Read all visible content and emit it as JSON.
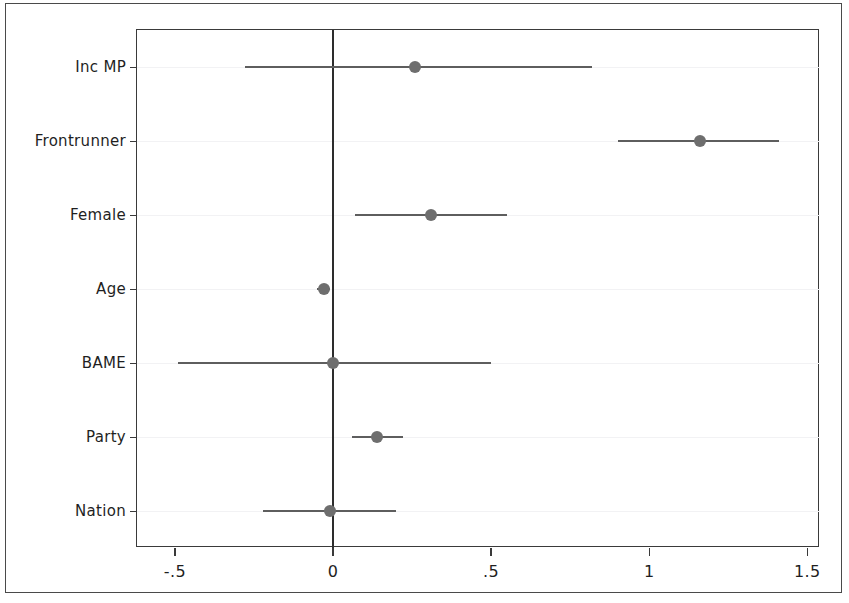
{
  "figure": {
    "background_color": "#ffffff",
    "frame_color": "#3a3a3a",
    "marker_color": "#6e6e6e",
    "ci_color": "#5e5e5e",
    "zero_line_color": "#2d2d2d",
    "gridline_color": "#f2f2f4"
  },
  "chart_data": {
    "type": "scatter",
    "subtype": "coefficient-plot",
    "title": "",
    "subtitle": "",
    "xlabel": "",
    "ylabel": "",
    "orientation": "horizontal",
    "grid": true,
    "legend": "none",
    "xlim": [
      -0.62,
      1.54
    ],
    "xticks": [
      -0.5,
      0,
      0.5,
      1,
      1.5
    ],
    "xticklabels": [
      "-.5",
      "0",
      ".5",
      "1",
      "1.5"
    ],
    "reference_line": 0,
    "categories": [
      "Inc MP",
      "Frontrunner",
      "Female",
      "Age",
      "BAME",
      "Party",
      "Nation"
    ],
    "series": [
      {
        "name": "Point estimate",
        "values": [
          0.26,
          1.16,
          0.31,
          -0.03,
          0.0,
          0.14,
          -0.01
        ]
      },
      {
        "name": "CI lower",
        "values": [
          -0.28,
          0.9,
          0.07,
          -0.05,
          -0.49,
          0.06,
          -0.22
        ]
      },
      {
        "name": "CI upper",
        "values": [
          0.82,
          1.41,
          0.55,
          -0.01,
          0.5,
          0.22,
          0.2
        ]
      }
    ],
    "points": [
      {
        "label": "Inc MP",
        "estimate": 0.26,
        "ci_low": -0.28,
        "ci_high": 0.82
      },
      {
        "label": "Frontrunner",
        "estimate": 1.16,
        "ci_low": 0.9,
        "ci_high": 1.41
      },
      {
        "label": "Female",
        "estimate": 0.31,
        "ci_low": 0.07,
        "ci_high": 0.55
      },
      {
        "label": "Age",
        "estimate": -0.03,
        "ci_low": -0.05,
        "ci_high": -0.01
      },
      {
        "label": "BAME",
        "estimate": 0.0,
        "ci_low": -0.49,
        "ci_high": 0.5
      },
      {
        "label": "Party",
        "estimate": 0.14,
        "ci_low": 0.06,
        "ci_high": 0.22
      },
      {
        "label": "Nation",
        "estimate": -0.01,
        "ci_low": -0.22,
        "ci_high": 0.2
      }
    ]
  }
}
